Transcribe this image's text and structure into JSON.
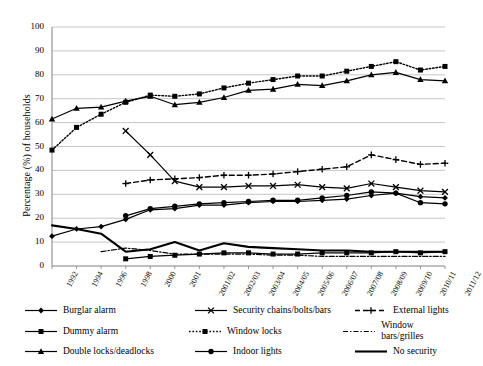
{
  "chart_data": {
    "type": "line",
    "title": "",
    "xlabel": "",
    "ylabel": "Percentage (%) of households",
    "ylim": [
      0,
      100
    ],
    "ytick_step": 10,
    "grid": true,
    "legend_position": "bottom",
    "categories": [
      "1992",
      "1994",
      "1996",
      "1998",
      "2000",
      "2001",
      "2001/02",
      "2002/03",
      "2003/04",
      "2004/05",
      "2005/06",
      "2006/07",
      "2007/08",
      "2008/09",
      "2009/10",
      "2010/11",
      "2011/12"
    ],
    "yticks": [
      "0",
      "10",
      "20",
      "30",
      "40",
      "50",
      "60",
      "70",
      "80",
      "90",
      "100"
    ],
    "series": [
      {
        "name": "Burglar alarm",
        "marker": "diamond",
        "line": "solid",
        "values": [
          12.5,
          15.5,
          16.5,
          19.5,
          23.5,
          24.0,
          25.5,
          25.5,
          26.5,
          27.0,
          27.0,
          27.5,
          28.0,
          29.5,
          30.5,
          29.0,
          28.5
        ]
      },
      {
        "name": "Dummy alarm",
        "marker": "square",
        "line": "solid",
        "values": [
          null,
          null,
          null,
          3.0,
          4.0,
          4.5,
          5.0,
          5.5,
          5.5,
          5.0,
          5.0,
          5.5,
          5.5,
          5.5,
          6.0,
          5.5,
          6.0
        ]
      },
      {
        "name": "Double locks/deadlocks",
        "marker": "triangle",
        "line": "solid",
        "values": [
          61.5,
          66.0,
          66.5,
          69.0,
          71.0,
          67.5,
          68.5,
          70.5,
          73.5,
          74.0,
          76.0,
          75.5,
          77.5,
          80.0,
          81.0,
          78.0,
          77.5
        ]
      },
      {
        "name": "Security chains/bolts/bars",
        "marker": "cross",
        "line": "solid",
        "values": [
          null,
          null,
          null,
          56.5,
          46.5,
          35.5,
          33.0,
          33.0,
          33.5,
          33.5,
          34.0,
          33.0,
          32.5,
          34.5,
          33.0,
          31.5,
          31.0
        ]
      },
      {
        "name": "Window locks",
        "marker": "square",
        "line": "dotted",
        "values": [
          48.5,
          58.0,
          63.5,
          68.5,
          71.5,
          71.0,
          72.0,
          74.5,
          76.5,
          78.0,
          79.5,
          79.5,
          81.5,
          83.5,
          85.5,
          82.0,
          83.5
        ]
      },
      {
        "name": "Indoor lights",
        "marker": "circle",
        "line": "solid",
        "values": [
          null,
          null,
          null,
          21.0,
          24.0,
          25.0,
          26.0,
          26.5,
          27.0,
          27.5,
          27.5,
          28.5,
          29.5,
          31.0,
          30.5,
          26.5,
          26.0
        ]
      },
      {
        "name": "External lights",
        "marker": "plus",
        "line": "dashed",
        "values": [
          null,
          null,
          null,
          34.5,
          36.0,
          36.5,
          37.0,
          38.0,
          38.0,
          38.5,
          39.5,
          40.5,
          41.5,
          46.5,
          44.5,
          42.5,
          43.0
        ]
      },
      {
        "name": "Window bars/grilles",
        "marker": "none",
        "line": "dashdot",
        "values": [
          null,
          null,
          6.0,
          7.5,
          6.5,
          5.0,
          5.0,
          5.0,
          5.0,
          4.5,
          4.5,
          4.0,
          4.0,
          4.0,
          4.0,
          4.0,
          4.0
        ]
      },
      {
        "name": "No security",
        "marker": "none",
        "line": "solid-thick",
        "values": [
          17.0,
          15.5,
          13.5,
          6.0,
          7.0,
          10.0,
          6.5,
          9.5,
          8.0,
          7.5,
          7.0,
          6.5,
          6.5,
          6.0,
          6.0,
          6.0,
          6.0
        ]
      }
    ]
  },
  "legend": {
    "items": [
      {
        "label": "Burglar alarm"
      },
      {
        "label": "Security chains/bolts/bars"
      },
      {
        "label": "External lights"
      },
      {
        "label": "Dummy alarm"
      },
      {
        "label": "Window locks"
      },
      {
        "label": "Window bars/grilles"
      },
      {
        "label": "Double locks/deadlocks"
      },
      {
        "label": "Indoor lights"
      },
      {
        "label": "No security"
      }
    ]
  },
  "colors": {
    "line": "#000000",
    "grid": "#b8b8b8",
    "axis": "#808080",
    "background": "#ffffff"
  }
}
